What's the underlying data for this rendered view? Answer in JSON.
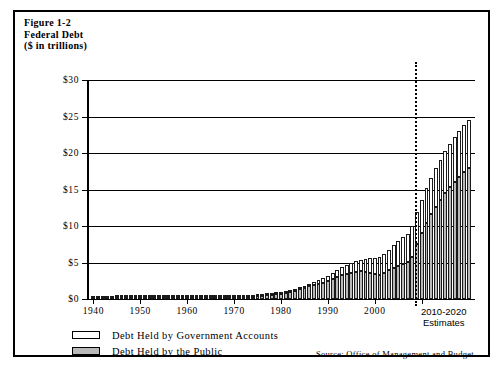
{
  "figure": {
    "title_lines": [
      "Figure 1-2",
      "Federal Debt",
      "($ in trillions)"
    ],
    "title_line_1": "Figure 1-2",
    "title_line_2": "Federal Debt",
    "title_line_3": "($ in trillions)",
    "source_note": "Source: Office of Management and Budget",
    "estimates_label_line1": "2010-2020",
    "estimates_label_line2": "Estimates"
  },
  "legend": {
    "items": [
      {
        "label": "Debt Held by Government Accounts",
        "color": "#ffffff"
      },
      {
        "label": "Debt Held by the Public",
        "color": "#b9b9b9"
      }
    ]
  },
  "chart_data": {
    "type": "bar",
    "stacked": true,
    "title": "Figure 1-2 Federal Debt ($ in trillions)",
    "subtitle": "($ in trillions)",
    "xlabel": "",
    "ylabel": "$ in trillions",
    "ylim": [
      0,
      30
    ],
    "ytick_values": [
      0,
      5,
      10,
      15,
      20,
      25,
      30
    ],
    "ytick_labels": [
      "$0",
      "$5",
      "$10",
      "$15",
      "$20",
      "$25",
      "$30"
    ],
    "xtick_values": [
      1940,
      1950,
      1960,
      1970,
      1980,
      1990,
      2000,
      2010
    ],
    "xtick_labels": [
      "1940",
      "1950",
      "1960",
      "1970",
      "1980",
      "1990",
      "2000",
      "2010-2020 Estimates"
    ],
    "grid": true,
    "legend_position": "below-left",
    "annotations": [
      {
        "type": "vline",
        "x": 2008.5,
        "style": "dotted",
        "note": "actual / estimate divider"
      },
      {
        "type": "text",
        "text": "2010-2020 Estimates",
        "x": 2014
      },
      {
        "type": "text",
        "text": "Source: Office of Management and Budget"
      }
    ],
    "x": [
      1940,
      1941,
      1942,
      1943,
      1944,
      1945,
      1946,
      1947,
      1948,
      1949,
      1950,
      1951,
      1952,
      1953,
      1954,
      1955,
      1956,
      1957,
      1958,
      1959,
      1960,
      1961,
      1962,
      1963,
      1964,
      1965,
      1966,
      1967,
      1968,
      1969,
      1970,
      1971,
      1972,
      1973,
      1974,
      1975,
      1976,
      1977,
      1978,
      1979,
      1980,
      1981,
      1982,
      1983,
      1984,
      1985,
      1986,
      1987,
      1988,
      1989,
      1990,
      1991,
      1992,
      1993,
      1994,
      1995,
      1996,
      1997,
      1998,
      1999,
      2000,
      2001,
      2002,
      2003,
      2004,
      2005,
      2006,
      2007,
      2008,
      2009,
      2010,
      2011,
      2012,
      2013,
      2014,
      2015,
      2016,
      2017,
      2018,
      2019,
      2020
    ],
    "series": [
      {
        "name": "Debt Held by the Public",
        "color": "#b9b9b9",
        "values": [
          0.04,
          0.06,
          0.08,
          0.14,
          0.18,
          0.24,
          0.24,
          0.22,
          0.22,
          0.22,
          0.22,
          0.21,
          0.21,
          0.22,
          0.22,
          0.23,
          0.22,
          0.22,
          0.23,
          0.24,
          0.24,
          0.25,
          0.25,
          0.26,
          0.26,
          0.26,
          0.26,
          0.26,
          0.29,
          0.28,
          0.28,
          0.3,
          0.32,
          0.34,
          0.34,
          0.39,
          0.48,
          0.55,
          0.61,
          0.64,
          0.71,
          0.79,
          0.92,
          1.14,
          1.31,
          1.51,
          1.74,
          1.89,
          2.05,
          2.19,
          2.41,
          2.69,
          2.99,
          3.25,
          3.43,
          3.6,
          3.73,
          3.77,
          3.72,
          3.63,
          3.41,
          3.34,
          3.55,
          3.92,
          4.3,
          4.59,
          4.83,
          5.04,
          5.8,
          7.55,
          9.02,
          10.43,
          11.58,
          12.6,
          13.56,
          14.48,
          15.3,
          16.06,
          16.75,
          17.38,
          17.9
        ]
      },
      {
        "name": "Debt Held by Government Accounts",
        "color": "#ffffff",
        "values": [
          0.01,
          0.01,
          0.01,
          0.01,
          0.02,
          0.02,
          0.03,
          0.03,
          0.04,
          0.04,
          0.04,
          0.05,
          0.05,
          0.05,
          0.05,
          0.05,
          0.05,
          0.06,
          0.06,
          0.06,
          0.05,
          0.06,
          0.06,
          0.06,
          0.06,
          0.06,
          0.06,
          0.07,
          0.08,
          0.09,
          0.1,
          0.1,
          0.11,
          0.12,
          0.14,
          0.15,
          0.15,
          0.16,
          0.17,
          0.19,
          0.2,
          0.21,
          0.22,
          0.24,
          0.26,
          0.31,
          0.37,
          0.44,
          0.55,
          0.68,
          0.8,
          0.91,
          1.0,
          1.1,
          1.21,
          1.32,
          1.45,
          1.6,
          1.76,
          1.97,
          2.22,
          2.45,
          2.66,
          2.85,
          3.07,
          3.31,
          3.66,
          3.92,
          4.18,
          4.35,
          4.54,
          4.79,
          5.04,
          5.29,
          5.52,
          5.73,
          5.93,
          6.11,
          6.3,
          6.46,
          6.6
        ]
      }
    ]
  }
}
